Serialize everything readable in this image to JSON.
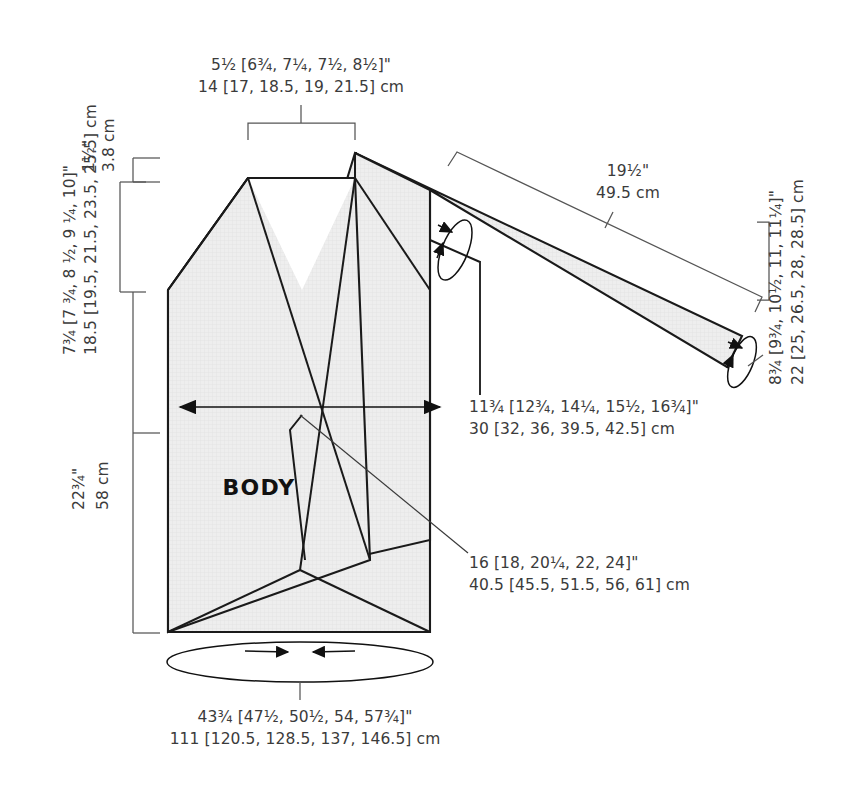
{
  "diagram": {
    "piece_label": "BODY",
    "colors": {
      "piece_fill": "#eeeeee",
      "outline": "#1a1a1a",
      "dimension_line": "#555555",
      "label_text": "#3b3b3b",
      "background": "#ffffff"
    },
    "measurements": {
      "shoulder_width": {
        "name": "shoulder-neck-width",
        "imperial": "5½ [6¾, 7¼, 7½, 8½]\"",
        "metric": "14 [17, 18.5, 19, 21.5] cm",
        "position": "top"
      },
      "neck_depth": {
        "name": "neck-drop",
        "imperial": "1½\"",
        "metric": "3.8 cm",
        "position": "left-upper"
      },
      "armhole_depth": {
        "name": "armhole-depth",
        "imperial": "7¾ [7 ¾, 8 ½, 9 ¼, 10]\"",
        "metric": "18.5 [19.5, 21.5, 23.5, 25.5] cm",
        "position": "left-middle"
      },
      "body_length": {
        "name": "body-length",
        "imperial": "22¾\"",
        "metric": "58 cm",
        "position": "left-lower"
      },
      "sleeve_length": {
        "name": "sleeve-length",
        "imperial": "19½\"",
        "metric": "49.5 cm",
        "position": "sleeve-top"
      },
      "upper_arm": {
        "name": "upper-arm-circumference",
        "imperial": "11¾ [12¾, 14¼, 15½, 16¾]\"",
        "metric": "30 [32, 36, 39.5, 42.5] cm",
        "position": "center-callout"
      },
      "cuff": {
        "name": "cuff-circumference",
        "imperial": "8¾ [9¾, 10½, 11, 11¼]\"",
        "metric": "22 [25, 26.5, 28, 28.5] cm",
        "position": "right"
      },
      "cross_back": {
        "name": "cross-back-width",
        "imperial": "16 [18, 20¼, 22, 24]\"",
        "metric": "40.5 [45.5, 51.5, 56, 61] cm",
        "position": "lower-callout"
      },
      "hem_circumference": {
        "name": "hem-circumference",
        "imperial": "43¾ [47½, 50½, 54, 57¾]\"",
        "metric": "111 [120.5, 128.5, 137, 146.5] cm",
        "position": "bottom"
      }
    },
    "icons": {
      "arrow_left_right": "double-headed-arrow",
      "ellipse_circumference": "circumference-loop-arrow",
      "bracket": "dimension-bracket"
    }
  }
}
